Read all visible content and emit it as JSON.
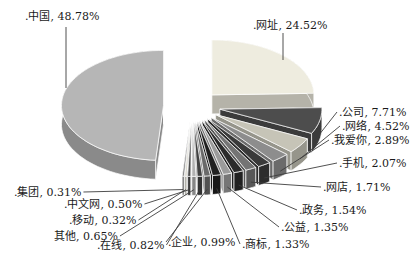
{
  "chart_data": {
    "type": "pie",
    "style": "3d_exploded",
    "title": "",
    "unit": "percent",
    "legend_position": "none",
    "background_color": "#ffffff",
    "label_color": "#1a1a1a",
    "leader_line_color": "#3d3d3d",
    "start_angle_deg": 0,
    "direction": "clockwise",
    "slices": [
      {
        "label": ".网址",
        "value": 24.52,
        "display": ".网址, 24.52%",
        "color": "#eeecdf"
      },
      {
        "label": ".公司",
        "value": 7.71,
        "display": ".公司, 7.71%",
        "color": "#4d4d4d"
      },
      {
        "label": ".网络",
        "value": 4.52,
        "display": ".网络, 4.52%",
        "color": "#c6c4b7"
      },
      {
        "label": ".我爱你",
        "value": 2.89,
        "display": ".我爱你, 2.89%",
        "color": "#8d8d8d"
      },
      {
        "label": ".手机",
        "value": 2.07,
        "display": ".手机, 2.07%",
        "color": "#3a3a3a"
      },
      {
        "label": ".网店",
        "value": 1.71,
        "display": ".网店, 1.71%",
        "color": "#747474"
      },
      {
        "label": ".政务",
        "value": 1.54,
        "display": ".政务, 1.54%",
        "color": "#2b2b2b"
      },
      {
        "label": ".公益",
        "value": 1.35,
        "display": ".公益, 1.35%",
        "color": "#9b9b9b"
      },
      {
        "label": ".商标",
        "value": 1.33,
        "display": ".商标, 1.33%",
        "color": "#202020"
      },
      {
        "label": ".企业",
        "value": 0.99,
        "display": ".企业, 0.99%",
        "color": "#6a6a6a"
      },
      {
        "label": ".在线",
        "value": 0.82,
        "display": ".在线, 0.82%",
        "color": "#424242"
      },
      {
        "label": "其他",
        "value": 0.65,
        "display": "其他, 0.65%",
        "color": "#b2b2b2"
      },
      {
        "label": ".中文网",
        "value": 0.5,
        "display": ".中文网, 0.50%",
        "color": "#4c4c4c"
      },
      {
        "label": ".移动",
        "value": 0.32,
        "display": ".移动, 0.32%",
        "color": "#d3d1c5"
      },
      {
        "label": ".集团",
        "value": 0.31,
        "display": ".集团, 0.31%",
        "color": "#838383"
      },
      {
        "label": ".中国",
        "value": 48.78,
        "display": ".中国, 48.78%",
        "color": "#b6b6b6"
      }
    ]
  }
}
